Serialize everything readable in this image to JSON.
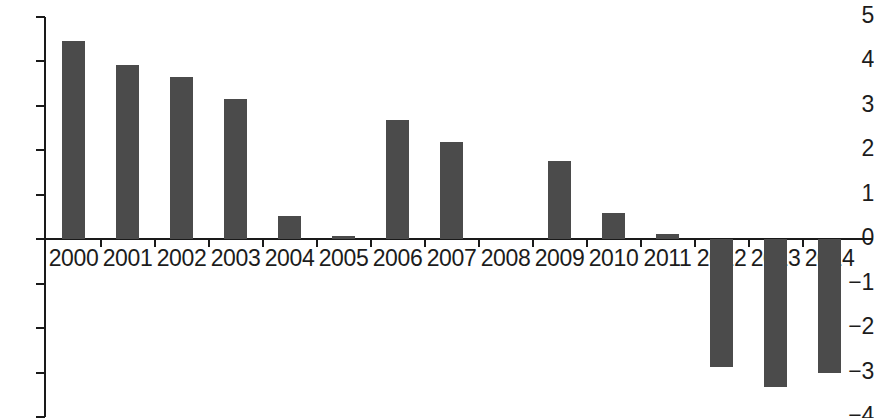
{
  "chart_data": {
    "type": "bar",
    "title": "",
    "subtitle": "",
    "xlabel": "",
    "ylabel": "",
    "categories": [
      "2000",
      "2001",
      "2002",
      "2003",
      "2004",
      "2005",
      "2006",
      "2007",
      "2008",
      "2009",
      "2010",
      "2011",
      "2012",
      "2013",
      "2014"
    ],
    "values": [
      4.45,
      3.93,
      3.65,
      3.15,
      0.52,
      0.07,
      2.68,
      2.19,
      0.0,
      1.77,
      0.6,
      0.12,
      -2.87,
      -3.33,
      -3.02
    ],
    "ylim": [
      -4,
      5
    ],
    "yticks": [
      5,
      4,
      3,
      2,
      1,
      0,
      -1,
      -2,
      -3,
      -4
    ],
    "ytick_labels": [
      "5",
      "4",
      "3",
      "2",
      "1",
      "0",
      "−1",
      "−2",
      "−3",
      "−4"
    ],
    "grid": false,
    "legend": null,
    "bar_color": "#4b4b4b",
    "axis_color": "#1a1a1a",
    "background": "#ffffff",
    "annotations": []
  }
}
